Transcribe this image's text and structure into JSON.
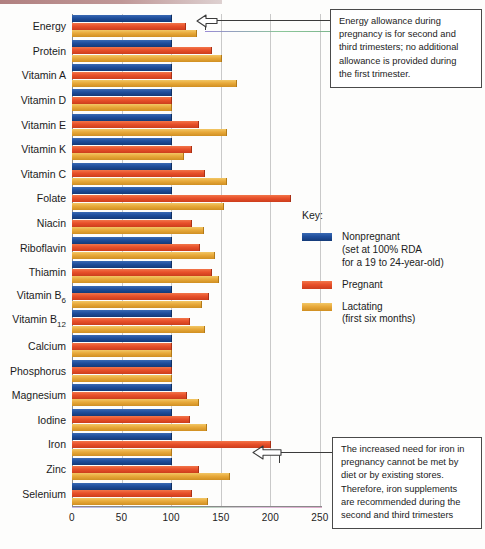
{
  "chart_data": {
    "type": "bar",
    "orientation": "horizontal",
    "title": "",
    "xlabel": "",
    "ylabel": "",
    "xlim": [
      0,
      250
    ],
    "xticks": [
      0,
      50,
      100,
      150,
      200,
      250
    ],
    "grid": true,
    "legend_position": "right",
    "categories": [
      "Energy",
      "Protein",
      "Vitamin A",
      "Vitamin D",
      "Vitamin E",
      "Vitamin K",
      "Vitamin C",
      "Folate",
      "Niacin",
      "Riboflavin",
      "Thiamin",
      "Vitamin B6",
      "Vitamin B12",
      "Calcium",
      "Phosphorus",
      "Magnesium",
      "Iodine",
      "Iron",
      "Zinc",
      "Selenium"
    ],
    "series": [
      {
        "name": "Nonpregnant",
        "color": "#1f4e9c",
        "values": [
          100,
          100,
          100,
          100,
          100,
          100,
          100,
          100,
          100,
          100,
          100,
          100,
          100,
          100,
          100,
          100,
          100,
          100,
          100,
          100
        ]
      },
      {
        "name": "Pregnant",
        "color": "#e8502a",
        "values": [
          114,
          140,
          100,
          100,
          127,
          120,
          133,
          220,
          120,
          128,
          140,
          137,
          118,
          100,
          100,
          115,
          118,
          200,
          127,
          120
        ]
      },
      {
        "name": "Lactating",
        "color": "#e8a93a",
        "values": [
          125,
          150,
          165,
          100,
          155,
          112,
          155,
          152,
          132,
          143,
          147,
          130,
          133,
          100,
          100,
          127,
          135,
          100,
          158,
          136
        ]
      }
    ]
  },
  "axis": {
    "tick_labels": [
      "0",
      "50",
      "100",
      "150",
      "200",
      "250"
    ]
  },
  "row_labels": [
    {
      "text": "Energy"
    },
    {
      "text": "Protein"
    },
    {
      "text": "Vitamin A"
    },
    {
      "text": "Vitamin D"
    },
    {
      "text": "Vitamin E"
    },
    {
      "text": "Vitamin K"
    },
    {
      "text": "Vitamin C"
    },
    {
      "text": "Folate"
    },
    {
      "text": "Niacin"
    },
    {
      "text": "Riboflavin"
    },
    {
      "text": "Thiamin"
    },
    {
      "text": "Vitamin B",
      "sub": "6"
    },
    {
      "text": "Vitamin B",
      "sub": "12"
    },
    {
      "text": "Calcium"
    },
    {
      "text": "Phosphorus"
    },
    {
      "text": "Magnesium"
    },
    {
      "text": "Iodine"
    },
    {
      "text": "Iron"
    },
    {
      "text": "Zinc"
    },
    {
      "text": "Selenium"
    }
  ],
  "legend": {
    "title": "Key:",
    "items": [
      {
        "label": "Nonpregnant",
        "sub1": "(set at 100% RDA",
        "sub2": "for a 19 to 24-year-old)",
        "color": "#1f4e9c"
      },
      {
        "label": "Pregnant",
        "sub1": "",
        "sub2": "",
        "color": "#e8502a"
      },
      {
        "label": "Lactating",
        "sub1": "(first six months)",
        "sub2": "",
        "color": "#e8a93a"
      }
    ]
  },
  "notes": {
    "energy": {
      "lines": [
        "Energy allowance during",
        "pregnancy is for second and",
        "third trimesters; no additional",
        "allowance is provided during",
        "the first trimester."
      ]
    },
    "iron": {
      "lines": [
        "The increased need for iron in",
        "pregnancy cannot be met by",
        "diet or by existing stores.",
        "Therefore, iron supplements",
        "are recommended during the",
        "second and third trimesters"
      ]
    }
  }
}
